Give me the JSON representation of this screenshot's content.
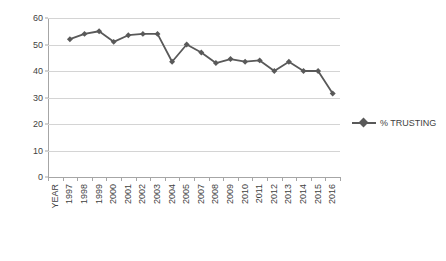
{
  "chart_data": {
    "type": "line",
    "title": "",
    "xlabel": "",
    "ylabel": "",
    "ylim": [
      0,
      60
    ],
    "ytick_step": 10,
    "yticks": [
      0,
      10,
      20,
      30,
      40,
      50,
      60
    ],
    "grid": true,
    "legend_position": "right",
    "axis_first_label": "YEAR",
    "categories": [
      "1997",
      "1998",
      "1999",
      "2000",
      "2001",
      "2002",
      "2003",
      "2004",
      "2005",
      "2007",
      "2008",
      "2009",
      "2010",
      "2011",
      "2012",
      "2013",
      "2014",
      "2015",
      "2016"
    ],
    "tick_labels": [
      "YEAR",
      "1997",
      "1998",
      "1999",
      "2000",
      "2001",
      "2002",
      "2003",
      "2004",
      "2005",
      "2007",
      "2008",
      "2009",
      "2010",
      "2011",
      "2012",
      "2013",
      "2014",
      "2015",
      "2016"
    ],
    "series": [
      {
        "name": "% TRUSTING",
        "color": "#595959",
        "marker": "diamond",
        "values": [
          52,
          54,
          55,
          51,
          53.5,
          54,
          54,
          43.5,
          50,
          47,
          43,
          44.5,
          43.5,
          44,
          40,
          43.5,
          40,
          40,
          31.5
        ]
      }
    ]
  },
  "legend": {
    "entries": [
      {
        "label": "% TRUSTING",
        "marker": "line-diamond-marker"
      }
    ]
  }
}
